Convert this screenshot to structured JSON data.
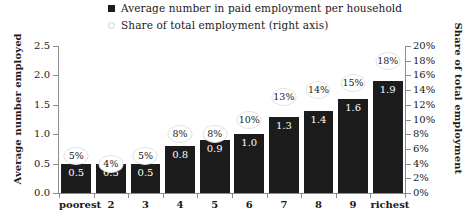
{
  "legend": {
    "entries": [
      {
        "label": "Average number in paid employment per household",
        "marker": "filled-square",
        "color": "#1c1c1c"
      },
      {
        "label": "Share of total employment (right axis)",
        "marker": "hollow-circle",
        "color": "#ffffff"
      }
    ]
  },
  "axes": {
    "left_title": "Average number employed",
    "right_title": "Share of total employment",
    "left_ticks": [
      "0.0",
      "0.5",
      "1.0",
      "1.5",
      "2.0",
      "2.5"
    ],
    "right_ticks": [
      "0%",
      "2%",
      "4%",
      "6%",
      "8%",
      "10%",
      "12%",
      "14%",
      "16%",
      "18%",
      "20%"
    ]
  },
  "chart_data": {
    "type": "bar",
    "title": "",
    "xlabel": "",
    "ylabel": "Average number employed",
    "y2label": "Share of total employment",
    "categories": [
      "poorest",
      "2",
      "3",
      "4",
      "5",
      "6",
      "7",
      "8",
      "9",
      "richest"
    ],
    "series": [
      {
        "name": "Average number in paid employment per household",
        "axis": "left",
        "type": "bar",
        "values": [
          0.5,
          0.5,
          0.5,
          0.8,
          0.9,
          1.0,
          1.3,
          1.4,
          1.6,
          1.9
        ],
        "labels": [
          "0.5",
          "0.5",
          "0.5",
          "0.8",
          "0.9",
          "1.0",
          "1.3",
          "1.4",
          "1.6",
          "1.9"
        ],
        "color": "#1c1c1c"
      },
      {
        "name": "Share of total employment (right axis)",
        "axis": "right",
        "type": "point",
        "values": [
          5,
          4,
          5,
          8,
          8,
          10,
          13,
          14,
          15,
          18
        ],
        "labels": [
          "5%",
          "4%",
          "5%",
          "8%",
          "8%",
          "10%",
          "13%",
          "14%",
          "15%",
          "18%"
        ],
        "color": "#ffffff"
      }
    ],
    "ylim": [
      0,
      2.5
    ],
    "y2lim": [
      0,
      20
    ],
    "grid": false,
    "legend_position": "top"
  }
}
